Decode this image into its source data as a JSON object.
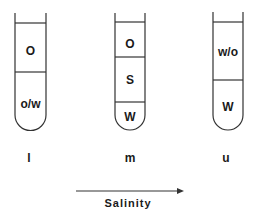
{
  "diagram": {
    "type": "phase-behavior-tubes",
    "tubes": [
      {
        "id": "l",
        "label": "l",
        "phases": [
          {
            "label": "O"
          },
          {
            "label": "o/w"
          }
        ]
      },
      {
        "id": "m",
        "label": "m",
        "phases": [
          {
            "label": "O"
          },
          {
            "label": "S"
          },
          {
            "label": "W"
          }
        ]
      },
      {
        "id": "u",
        "label": "u",
        "phases": [
          {
            "label": "w/o"
          },
          {
            "label": "W"
          }
        ]
      }
    ],
    "axis": {
      "label": "Salinity",
      "direction": "increasing-right"
    },
    "colors": {
      "line": "#333333",
      "text": "#1a1a1a",
      "background": "#ffffff"
    }
  }
}
